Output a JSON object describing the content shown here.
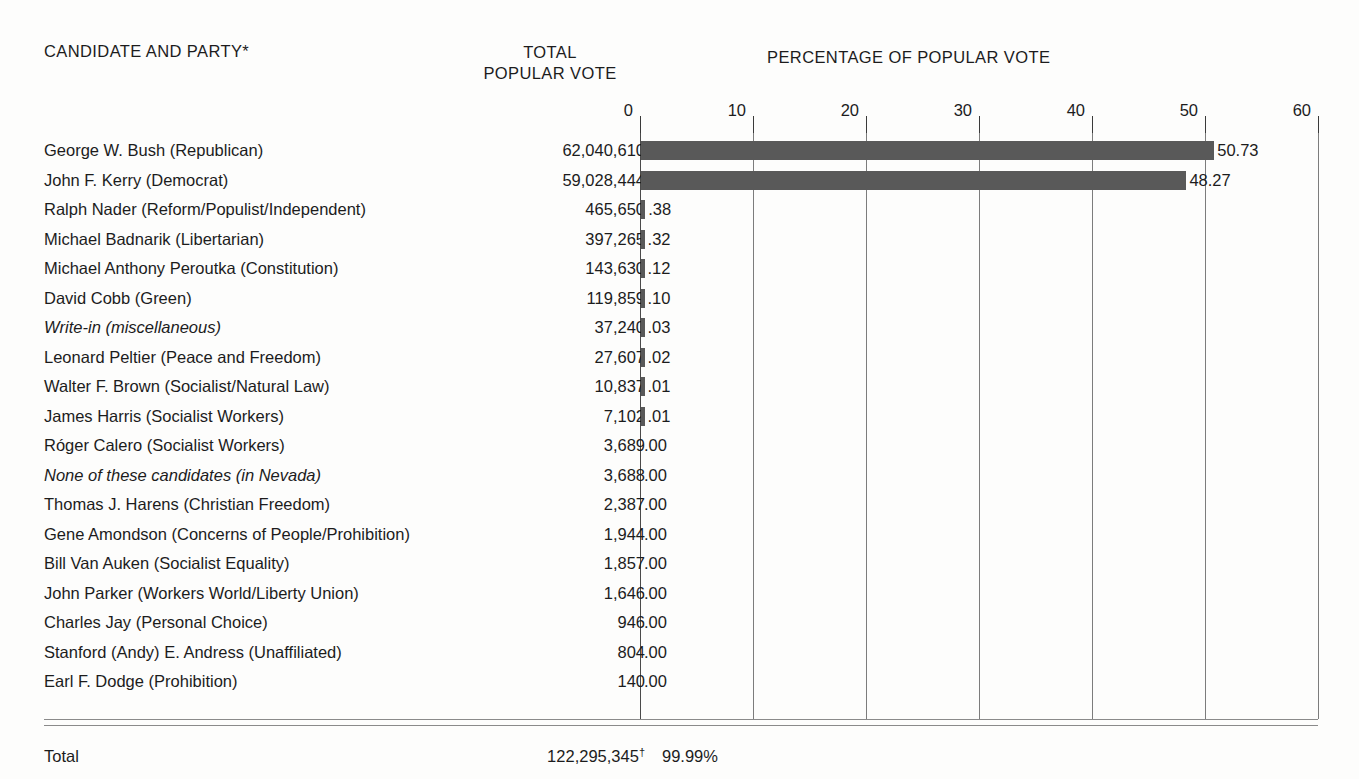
{
  "headers": {
    "candidate": "CANDIDATE AND PARTY*",
    "total_line1": "TOTAL",
    "total_line2": "POPULAR VOTE",
    "percentage": "PERCENTAGE OF POPULAR VOTE"
  },
  "total_row": {
    "label": "Total",
    "votes": "122,295,345",
    "votes_footnote": "†",
    "percent": "99.99%"
  },
  "colors": {
    "bar": "#595959",
    "gridline": "#7c7c7c",
    "rule": "#8a8a8a",
    "text": "#1c1c1c",
    "background": "#fdfdfc"
  },
  "chart_data": {
    "type": "bar",
    "title": "PERCENTAGE OF POPULAR VOTE",
    "xlabel": "",
    "ylabel": "",
    "orientation": "horizontal",
    "xlim": [
      0,
      60
    ],
    "xticks": [
      0,
      10,
      20,
      30,
      40,
      50,
      60
    ],
    "xtick_labels": [
      "0",
      "10",
      "20",
      "30",
      "40",
      "50",
      "60"
    ],
    "grid": true,
    "legend": false,
    "categories": [
      "George W. Bush (Republican)",
      "John F. Kerry (Democrat)",
      "Ralph Nader (Reform/Populist/Independent)",
      "Michael Badnarik (Libertarian)",
      "Michael Anthony Peroutka (Constitution)",
      "David Cobb (Green)",
      "Write-in (miscellaneous)",
      "Leonard Peltier (Peace and Freedom)",
      "Walter F. Brown (Socialist/Natural Law)",
      "James Harris (Socialist Workers)",
      "Róger Calero (Socialist Workers)",
      "None of these candidates (in Nevada)",
      "Thomas J. Harens (Christian Freedom)",
      "Gene Amondson (Concerns of People/Prohibition)",
      "Bill Van Auken (Socialist Equality)",
      "John Parker (Workers World/Liberty Union)",
      "Charles Jay (Personal Choice)",
      "Stanford (Andy) E. Andress (Unaffiliated)",
      "Earl F. Dodge (Prohibition)"
    ],
    "values": [
      50.73,
      48.27,
      0.38,
      0.32,
      0.12,
      0.1,
      0.03,
      0.02,
      0.01,
      0.01,
      0.0,
      0.0,
      0.0,
      0.0,
      0.0,
      0.0,
      0.0,
      0.0,
      0.0
    ],
    "value_labels": [
      ".50.73",
      "48.27",
      ".38",
      ".32",
      ".12",
      ".10",
      ".03",
      ".02",
      ".01",
      ".01",
      ".00",
      ".00",
      ".00",
      ".00",
      ".00",
      ".00",
      ".00",
      ".00",
      ".00"
    ]
  },
  "rows": [
    {
      "candidate": "George W. Bush (Republican)",
      "italic": false,
      "votes": "62,040,610",
      "pct_label": "50.73",
      "pct_value": 50.73
    },
    {
      "candidate": "John F. Kerry (Democrat)",
      "italic": false,
      "votes": "59,028,444",
      "pct_label": "48.27",
      "pct_value": 48.27
    },
    {
      "candidate": "Ralph Nader (Reform/Populist/Independent)",
      "italic": false,
      "votes": "465,650",
      "pct_label": ".38",
      "pct_value": 0.38
    },
    {
      "candidate": "Michael Badnarik (Libertarian)",
      "italic": false,
      "votes": "397,265",
      "pct_label": ".32",
      "pct_value": 0.32
    },
    {
      "candidate": "Michael Anthony Peroutka (Constitution)",
      "italic": false,
      "votes": "143,630",
      "pct_label": ".12",
      "pct_value": 0.12
    },
    {
      "candidate": "David Cobb (Green)",
      "italic": false,
      "votes": "119,859",
      "pct_label": ".10",
      "pct_value": 0.1
    },
    {
      "candidate": "Write-in (miscellaneous)",
      "italic": true,
      "votes": "37,240",
      "pct_label": ".03",
      "pct_value": 0.03
    },
    {
      "candidate": "Leonard Peltier (Peace and Freedom)",
      "italic": false,
      "votes": "27,607",
      "pct_label": ".02",
      "pct_value": 0.02
    },
    {
      "candidate": "Walter F. Brown (Socialist/Natural Law)",
      "italic": false,
      "votes": "10,837",
      "pct_label": ".01",
      "pct_value": 0.01
    },
    {
      "candidate": "James Harris (Socialist Workers)",
      "italic": false,
      "votes": "7,102",
      "pct_label": ".01",
      "pct_value": 0.01
    },
    {
      "candidate": "Róger Calero (Socialist Workers)",
      "italic": false,
      "votes": "3,689",
      "pct_label": ".00",
      "pct_value": 0.0
    },
    {
      "candidate": "None of these candidates (in Nevada)",
      "italic": true,
      "votes": "3,688",
      "pct_label": ".00",
      "pct_value": 0.0
    },
    {
      "candidate": "Thomas J. Harens (Christian Freedom)",
      "italic": false,
      "votes": "2,387",
      "pct_label": ".00",
      "pct_value": 0.0
    },
    {
      "candidate": "Gene Amondson (Concerns of People/Prohibition)",
      "italic": false,
      "votes": "1,944",
      "pct_label": ".00",
      "pct_value": 0.0
    },
    {
      "candidate": "Bill Van Auken (Socialist Equality)",
      "italic": false,
      "votes": "1,857",
      "pct_label": ".00",
      "pct_value": 0.0
    },
    {
      "candidate": "John Parker (Workers World/Liberty Union)",
      "italic": false,
      "votes": "1,646",
      "pct_label": ".00",
      "pct_value": 0.0
    },
    {
      "candidate": "Charles Jay (Personal Choice)",
      "italic": false,
      "votes": "946",
      "pct_label": ".00",
      "pct_value": 0.0
    },
    {
      "candidate": "Stanford (Andy) E. Andress (Unaffiliated)",
      "italic": false,
      "votes": "804",
      "pct_label": ".00",
      "pct_value": 0.0
    },
    {
      "candidate": "Earl F. Dodge (Prohibition)",
      "italic": false,
      "votes": "140",
      "pct_label": ".00",
      "pct_value": 0.0
    }
  ]
}
